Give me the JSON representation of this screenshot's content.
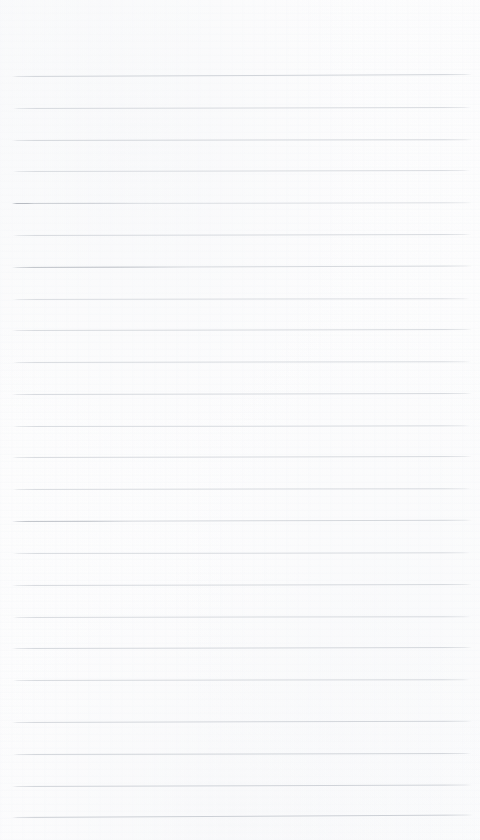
{
  "document": {
    "kind": "scanned-lined-paper",
    "title": "Blank ruled notebook page",
    "visible_text": "",
    "handwriting": "none",
    "printed_text": "none"
  },
  "page": {
    "width": 480,
    "height": 840,
    "background_color": "#fdfdfd",
    "paper_tone": "off-white",
    "top_margin_height": 76,
    "left_margin_x": 12,
    "right_margin_x": 472,
    "has_vertical_margin_rule": false,
    "has_header": false,
    "has_footer": false,
    "has_page_number": false,
    "has_holes": false
  },
  "ruling": {
    "type": "horizontal-ruled",
    "line_color": "#c8ccd2",
    "line_thickness_px": 1,
    "line_count": 24,
    "first_line_y": 76,
    "last_line_y": 817,
    "spacing_px": 32.2,
    "line_start_x": 12,
    "line_end_x": 472,
    "lines": [
      {
        "index": 1,
        "y": 76,
        "x1": 12,
        "x2": 472,
        "opacity": 0.82,
        "tilt_deg": -0.25,
        "accent_width": 0
      },
      {
        "index": 2,
        "y": 108,
        "x1": 13,
        "x2": 471,
        "opacity": 0.7,
        "tilt_deg": -0.12,
        "accent_width": 0
      },
      {
        "index": 3,
        "y": 140,
        "x1": 12,
        "x2": 472,
        "opacity": 0.74,
        "tilt_deg": -0.1,
        "accent_width": 0
      },
      {
        "index": 4,
        "y": 171,
        "x1": 13,
        "x2": 470,
        "opacity": 0.66,
        "tilt_deg": -0.14,
        "accent_width": 0
      },
      {
        "index": 5,
        "y": 203,
        "x1": 12,
        "x2": 472,
        "opacity": 0.58,
        "tilt_deg": -0.08,
        "accent_width": 130
      },
      {
        "index": 6,
        "y": 235,
        "x1": 13,
        "x2": 471,
        "opacity": 0.7,
        "tilt_deg": -0.12,
        "accent_width": 0
      },
      {
        "index": 7,
        "y": 267,
        "x1": 12,
        "x2": 472,
        "opacity": 0.72,
        "tilt_deg": -0.18,
        "accent_width": 175
      },
      {
        "index": 8,
        "y": 299,
        "x1": 13,
        "x2": 470,
        "opacity": 0.64,
        "tilt_deg": -0.1,
        "accent_width": 0
      },
      {
        "index": 9,
        "y": 330,
        "x1": 12,
        "x2": 472,
        "opacity": 0.7,
        "tilt_deg": -0.12,
        "accent_width": 0
      },
      {
        "index": 10,
        "y": 362,
        "x1": 13,
        "x2": 471,
        "opacity": 0.68,
        "tilt_deg": -0.1,
        "accent_width": 0
      },
      {
        "index": 11,
        "y": 394,
        "x1": 12,
        "x2": 472,
        "opacity": 0.72,
        "tilt_deg": -0.14,
        "accent_width": 0
      },
      {
        "index": 12,
        "y": 426,
        "x1": 13,
        "x2": 470,
        "opacity": 0.66,
        "tilt_deg": -0.08,
        "accent_width": 0
      },
      {
        "index": 13,
        "y": 457,
        "x1": 12,
        "x2": 472,
        "opacity": 0.7,
        "tilt_deg": -0.12,
        "accent_width": 0
      },
      {
        "index": 14,
        "y": 489,
        "x1": 13,
        "x2": 471,
        "opacity": 0.68,
        "tilt_deg": -0.1,
        "accent_width": 0
      },
      {
        "index": 15,
        "y": 521,
        "x1": 12,
        "x2": 472,
        "opacity": 0.74,
        "tilt_deg": -0.16,
        "accent_width": 120
      },
      {
        "index": 16,
        "y": 553,
        "x1": 13,
        "x2": 470,
        "opacity": 0.66,
        "tilt_deg": -0.08,
        "accent_width": 0
      },
      {
        "index": 17,
        "y": 585,
        "x1": 12,
        "x2": 472,
        "opacity": 0.72,
        "tilt_deg": -0.12,
        "accent_width": 0
      },
      {
        "index": 18,
        "y": 617,
        "x1": 13,
        "x2": 471,
        "opacity": 0.7,
        "tilt_deg": -0.1,
        "accent_width": 0
      },
      {
        "index": 19,
        "y": 648,
        "x1": 12,
        "x2": 472,
        "opacity": 0.76,
        "tilt_deg": -0.14,
        "accent_width": 0
      },
      {
        "index": 20,
        "y": 680,
        "x1": 13,
        "x2": 470,
        "opacity": 0.72,
        "tilt_deg": -0.1,
        "accent_width": 0
      },
      {
        "index": 21,
        "y": 722,
        "x1": 12,
        "x2": 472,
        "opacity": 0.78,
        "tilt_deg": -0.16,
        "accent_width": 0
      },
      {
        "index": 22,
        "y": 754,
        "x1": 13,
        "x2": 471,
        "opacity": 0.8,
        "tilt_deg": -0.12,
        "accent_width": 0
      },
      {
        "index": 23,
        "y": 786,
        "x1": 12,
        "x2": 472,
        "opacity": 0.84,
        "tilt_deg": -0.18,
        "accent_width": 0
      },
      {
        "index": 24,
        "y": 817,
        "x1": 12,
        "x2": 473,
        "opacity": 0.92,
        "tilt_deg": -0.3,
        "accent_width": 0
      }
    ]
  },
  "artifacts": {
    "left_dash": {
      "label": "faint dash mark",
      "x": 12,
      "y": 203,
      "width": 22,
      "color": "#b2b6bd"
    }
  }
}
